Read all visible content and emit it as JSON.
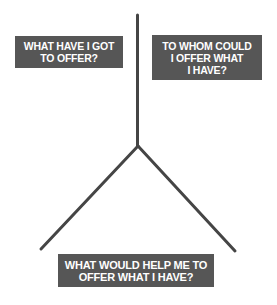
{
  "diagram": {
    "type": "y-shaped-branching-diagram",
    "line_color": "#454545",
    "box_color": "#565656",
    "text_color": "#ffffff",
    "boxes": [
      {
        "id": "offer",
        "lines": [
          "WHAT HAVE I GOT",
          "TO OFFER?"
        ]
      },
      {
        "id": "whom",
        "lines": [
          "TO WHOM COULD",
          "I OFFER WHAT",
          "I HAVE?"
        ]
      },
      {
        "id": "help",
        "lines": [
          "WHAT WOULD HELP ME TO",
          "OFFER WHAT I HAVE?"
        ]
      }
    ]
  }
}
